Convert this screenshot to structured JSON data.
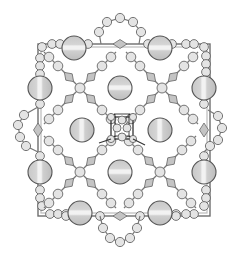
{
  "diagram": {
    "title": "",
    "colors": {
      "background": "#ffffff",
      "bond": "#777777",
      "small_atom_fill": "#e4e4e4",
      "large_atom_fill": "#c8c8c8",
      "large_atom_stripe": "#f0f0f0",
      "diamond_fill": "#c4c4c4",
      "cube_stroke": "#222222"
    },
    "frame": {
      "x": 38,
      "y": 44,
      "width": 172,
      "height": 172
    },
    "large_atoms": [
      {
        "cx": 74,
        "cy": 48,
        "r": 12
      },
      {
        "cx": 160,
        "cy": 48,
        "r": 12
      },
      {
        "cx": 40,
        "cy": 88,
        "r": 12
      },
      {
        "cx": 204,
        "cy": 88,
        "r": 12
      },
      {
        "cx": 40,
        "cy": 172,
        "r": 12
      },
      {
        "cx": 204,
        "cy": 172,
        "r": 12
      },
      {
        "cx": 80,
        "cy": 213,
        "r": 12
      },
      {
        "cx": 160,
        "cy": 213,
        "r": 12
      },
      {
        "cx": 120,
        "cy": 88,
        "r": 12
      },
      {
        "cx": 82,
        "cy": 130,
        "r": 12
      },
      {
        "cx": 160,
        "cy": 130,
        "r": 12
      },
      {
        "cx": 120,
        "cy": 172,
        "r": 12
      }
    ],
    "x_clusters": [
      {
        "cx": 80,
        "cy": 88
      },
      {
        "cx": 162,
        "cy": 88
      },
      {
        "cx": 80,
        "cy": 172
      },
      {
        "cx": 160,
        "cy": 172
      }
    ],
    "side_loops": [
      {
        "side": "top",
        "points": [
          [
            101,
            44
          ],
          [
            99,
            32
          ],
          [
            107,
            22
          ],
          [
            120,
            18
          ],
          [
            133,
            22
          ],
          [
            141,
            32
          ],
          [
            139,
            44
          ]
        ],
        "diamond": [
          120,
          44
        ]
      },
      {
        "side": "bottom",
        "points": [
          [
            100,
            216
          ],
          [
            103,
            228
          ],
          [
            110,
            238
          ],
          [
            120,
            242
          ],
          [
            130,
            238
          ],
          [
            137,
            228
          ],
          [
            140,
            216
          ]
        ],
        "diamond": [
          120,
          216
        ]
      },
      {
        "side": "left",
        "points": [
          [
            38,
            107
          ],
          [
            24,
            115
          ],
          [
            18,
            125
          ],
          [
            20,
            137
          ],
          [
            26,
            146
          ],
          [
            38,
            152
          ]
        ],
        "diamond": [
          38,
          130
        ]
      },
      {
        "side": "right",
        "points": [
          [
            208,
            110
          ],
          [
            218,
            116
          ],
          [
            222,
            128
          ],
          [
            218,
            140
          ],
          [
            210,
            146
          ],
          [
            204,
            152
          ]
        ],
        "diamond": [
          204,
          130
        ]
      }
    ],
    "central_cluster": {
      "cx": 122,
      "cy": 128,
      "size": 22,
      "label": "cubic core"
    }
  }
}
